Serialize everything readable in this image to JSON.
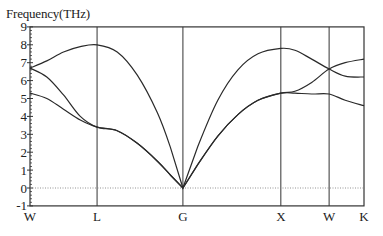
{
  "chart_data": {
    "type": "line",
    "title": "",
    "xlabel": "",
    "ylabel": "Frequency(THz)",
    "ylim": [
      -1,
      9
    ],
    "yticks": [
      -1,
      0,
      1,
      2,
      3,
      4,
      5,
      6,
      7,
      8,
      9
    ],
    "grid": false,
    "legend": null,
    "high_symmetry_points": [
      {
        "label": "W",
        "x": 0.0
      },
      {
        "label": "L",
        "x": 1.0
      },
      {
        "label": "G",
        "x": 2.28
      },
      {
        "label": "X",
        "x": 3.74
      },
      {
        "label": "W",
        "x": 4.46
      },
      {
        "label": "K",
        "x": 4.98
      }
    ],
    "zero_line": {
      "y": 0,
      "style": "dotted"
    },
    "series": [
      {
        "name": "acoustic-branch-1",
        "x": [
          0.0,
          0.25,
          0.5,
          0.75,
          1.0,
          1.3,
          1.6,
          1.9,
          2.1,
          2.28,
          2.5,
          2.8,
          3.1,
          3.4,
          3.74,
          3.95,
          4.2,
          4.46,
          4.7,
          4.98
        ],
        "y": [
          5.3,
          5.0,
          4.4,
          3.8,
          3.4,
          3.2,
          2.5,
          1.5,
          0.7,
          0.0,
          1.3,
          2.9,
          4.1,
          4.9,
          5.3,
          5.3,
          5.25,
          5.25,
          4.9,
          4.6
        ]
      },
      {
        "name": "acoustic-branch-2",
        "x": [
          0.0,
          0.25,
          0.5,
          0.75,
          1.0,
          1.3,
          1.6,
          1.9,
          2.1,
          2.28,
          2.5,
          2.8,
          3.1,
          3.4,
          3.74,
          3.95,
          4.2,
          4.46,
          4.7,
          4.98
        ],
        "y": [
          6.7,
          6.2,
          5.2,
          4.0,
          3.4,
          3.2,
          2.5,
          1.5,
          0.7,
          0.0,
          1.3,
          2.9,
          4.1,
          4.9,
          5.3,
          5.4,
          5.9,
          6.65,
          7.0,
          7.2
        ]
      },
      {
        "name": "acoustic-branch-3",
        "x": [
          0.0,
          0.25,
          0.5,
          0.75,
          1.0,
          1.3,
          1.6,
          1.9,
          2.1,
          2.28,
          2.5,
          2.8,
          3.1,
          3.4,
          3.74,
          3.95,
          4.2,
          4.46,
          4.7,
          4.98
        ],
        "y": [
          6.7,
          7.1,
          7.6,
          7.9,
          8.0,
          7.6,
          6.3,
          4.2,
          2.2,
          0.0,
          2.3,
          4.9,
          6.6,
          7.5,
          7.8,
          7.7,
          7.2,
          6.65,
          6.25,
          6.2
        ]
      }
    ]
  },
  "axis": {
    "ylabel": "Frequency(THz)"
  }
}
